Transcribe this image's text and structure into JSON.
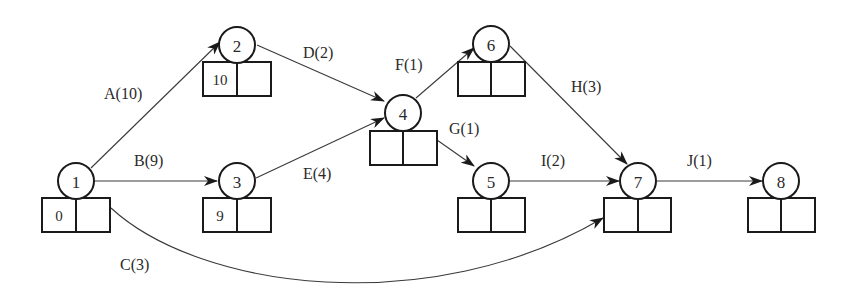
{
  "diagram": {
    "type": "activity-on-arrow network",
    "nodes": [
      {
        "id": "1",
        "label": "1",
        "es": "0",
        "ls": ""
      },
      {
        "id": "2",
        "label": "2",
        "es": "10",
        "ls": ""
      },
      {
        "id": "3",
        "label": "3",
        "es": "9",
        "ls": ""
      },
      {
        "id": "4",
        "label": "4",
        "es": "",
        "ls": ""
      },
      {
        "id": "5",
        "label": "5",
        "es": "",
        "ls": ""
      },
      {
        "id": "6",
        "label": "6",
        "es": "",
        "ls": ""
      },
      {
        "id": "7",
        "label": "7",
        "es": "",
        "ls": ""
      },
      {
        "id": "8",
        "label": "8",
        "es": "",
        "ls": ""
      }
    ],
    "edges": [
      {
        "id": "A",
        "from": "1",
        "to": "2",
        "label": "A(10)",
        "duration": 10
      },
      {
        "id": "B",
        "from": "1",
        "to": "3",
        "label": "B(9)",
        "duration": 9
      },
      {
        "id": "C",
        "from": "1",
        "to": "7",
        "label": "C(3)",
        "duration": 3
      },
      {
        "id": "D",
        "from": "2",
        "to": "4",
        "label": "D(2)",
        "duration": 2
      },
      {
        "id": "E",
        "from": "3",
        "to": "4",
        "label": "E(4)",
        "duration": 4
      },
      {
        "id": "F",
        "from": "4",
        "to": "6",
        "label": "F(1)",
        "duration": 1
      },
      {
        "id": "G",
        "from": "4",
        "to": "5",
        "label": "G(1)",
        "duration": 1
      },
      {
        "id": "H",
        "from": "6",
        "to": "7",
        "label": "H(3)",
        "duration": 3
      },
      {
        "id": "I",
        "from": "5",
        "to": "7",
        "label": "I(2)",
        "duration": 2
      },
      {
        "id": "J",
        "from": "7",
        "to": "8",
        "label": "J(1)",
        "duration": 1
      }
    ]
  },
  "colors": {
    "stroke": "#1a1a1a",
    "edge": "#3a3a3a",
    "text": "#2a2a2a",
    "background": "#ffffff"
  }
}
